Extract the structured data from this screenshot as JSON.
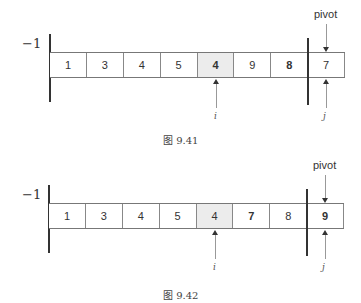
{
  "figures": [
    {
      "caption": "图 9.41",
      "left_marker": "−1",
      "pivot_label": "pivot",
      "cells": [
        {
          "value": "1",
          "shaded": false,
          "bold": false
        },
        {
          "value": "3",
          "shaded": false,
          "bold": false
        },
        {
          "value": "4",
          "shaded": false,
          "bold": false
        },
        {
          "value": "5",
          "shaded": false,
          "bold": false
        },
        {
          "value": "4",
          "shaded": true,
          "bold": true
        },
        {
          "value": "9",
          "shaded": false,
          "bold": false
        },
        {
          "value": "8",
          "shaded": false,
          "bold": true
        },
        {
          "value": "7",
          "shaded": false,
          "bold": false
        }
      ],
      "i_label": "i",
      "j_label": "j",
      "i_index": 4,
      "j_index": 7
    },
    {
      "caption": "图 9.42",
      "left_marker": "−1",
      "pivot_label": "pivot",
      "cells": [
        {
          "value": "1",
          "shaded": false,
          "bold": false
        },
        {
          "value": "3",
          "shaded": false,
          "bold": false
        },
        {
          "value": "4",
          "shaded": false,
          "bold": false
        },
        {
          "value": "5",
          "shaded": false,
          "bold": false
        },
        {
          "value": "4",
          "shaded": true,
          "bold": false
        },
        {
          "value": "7",
          "shaded": false,
          "bold": true
        },
        {
          "value": "8",
          "shaded": false,
          "bold": false
        },
        {
          "value": "9",
          "shaded": false,
          "bold": true
        }
      ],
      "i_label": "i",
      "j_label": "j",
      "i_index": 4,
      "j_index": 7
    }
  ]
}
